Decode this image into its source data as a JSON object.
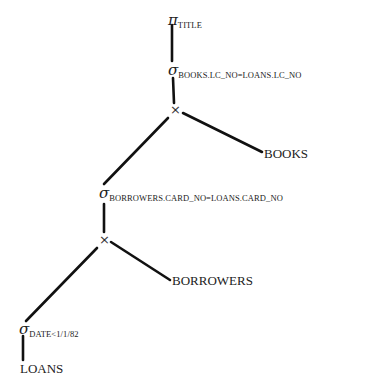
{
  "diagram": {
    "type": "relational-algebra-query-tree",
    "nodes": {
      "projection": {
        "op": "π",
        "condition": "TITLE"
      },
      "select_books": {
        "op": "σ",
        "condition": "BOOKS.LC_NO=LOANS.LC_NO"
      },
      "product_top": {
        "op": "×"
      },
      "books": {
        "label": "BOOKS"
      },
      "select_borrowers": {
        "op": "σ",
        "condition": "BORROWERS.CARD_NO=LOANS.CARD_NO"
      },
      "product_bottom": {
        "op": "×"
      },
      "borrowers": {
        "label": "BORROWERS"
      },
      "select_date": {
        "op": "σ",
        "condition": "DATE<1/1/82"
      },
      "loans": {
        "label": "LOANS"
      }
    },
    "edges": [
      [
        "projection",
        "select_books"
      ],
      [
        "select_books",
        "product_top"
      ],
      [
        "product_top",
        "books"
      ],
      [
        "product_top",
        "select_borrowers"
      ],
      [
        "select_borrowers",
        "product_bottom"
      ],
      [
        "product_bottom",
        "borrowers"
      ],
      [
        "product_bottom",
        "select_date"
      ],
      [
        "select_date",
        "loans"
      ]
    ],
    "line_color": "#111111"
  }
}
